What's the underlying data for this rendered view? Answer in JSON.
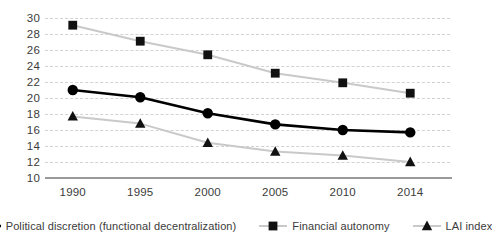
{
  "chart_data": {
    "type": "line",
    "title": "",
    "xlabel": "",
    "ylabel": "",
    "categories": [
      "1990",
      "1995",
      "2000",
      "2005",
      "2010",
      "2014"
    ],
    "ylim": [
      10,
      30
    ],
    "yticks": [
      10,
      12,
      14,
      16,
      18,
      20,
      22,
      24,
      26,
      28,
      30
    ],
    "grid": true,
    "legend_position": "bottom",
    "series": [
      {
        "name": "Political discretion (functional decentralization)",
        "marker": "circle",
        "color": "#000000",
        "line_color": "#000000",
        "values": [
          21.0,
          20.1,
          18.1,
          16.7,
          16.0,
          15.7
        ]
      },
      {
        "name": "Financial autonomy",
        "marker": "square",
        "color": "#111111",
        "line_color": "#c9c9c9",
        "values": [
          29.1,
          27.1,
          25.4,
          23.1,
          21.9,
          20.6
        ]
      },
      {
        "name": "LAI index",
        "marker": "triangle",
        "color": "#111111",
        "line_color": "#c9c9c9",
        "values": [
          17.7,
          16.8,
          14.4,
          13.3,
          12.8,
          12.0
        ]
      }
    ]
  },
  "legend": {
    "items": [
      {
        "label": "Political discretion (functional decentralization)"
      },
      {
        "label": "Financial autonomy"
      },
      {
        "label": "LAI index"
      }
    ]
  },
  "axes": {
    "y_ticks": [
      "30",
      "28",
      "26",
      "24",
      "22",
      "20",
      "18",
      "16",
      "14",
      "12",
      "10"
    ],
    "x_ticks": [
      "1990",
      "1995",
      "2000",
      "2005",
      "2010",
      "2014"
    ]
  }
}
